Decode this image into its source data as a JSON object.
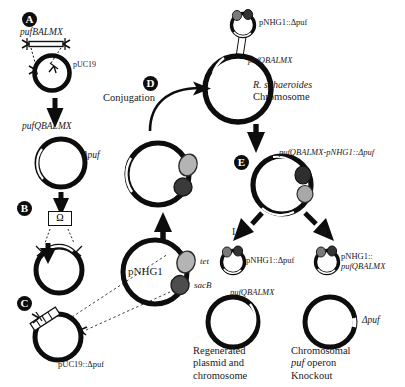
{
  "figure": {
    "width": 405,
    "height": 387,
    "background_color": "#ffffff",
    "ink_color": "#000000",
    "label_color": "#1a1a1a",
    "tet_marker_color": "#b4b4b4",
    "sacb_marker_color": "#4d4d4d",
    "caption_color": "#5d5d5d"
  },
  "steps": [
    {
      "id": "A",
      "letter": "A"
    },
    {
      "id": "B",
      "letter": "B"
    },
    {
      "id": "C",
      "letter": "C"
    },
    {
      "id": "D",
      "letter": "D"
    },
    {
      "id": "E",
      "letter": "E"
    }
  ],
  "branches": [
    {
      "id": "I",
      "label": "I"
    },
    {
      "id": "II",
      "label": "II"
    }
  ],
  "labels": {
    "puf_fragment": "pufBALMX",
    "puc19": "pUC19",
    "puf_qbalmx_plasmid": "pufQBALMX",
    "omega_cassette": "Ω",
    "puc19_delta_puf": "pUC19::Δpuf",
    "delta_puf": "Δpuf",
    "pnhg1": "pNHG1",
    "tet_marker": "tet",
    "sacb_marker": "sacB",
    "conjugation": "Conjugation",
    "pnhg1_delta_puf": "pNHG1::Δpuf",
    "chromosome_puf_operon": "pufQBALMX",
    "host_species": "R. sphaeroides",
    "host_structure": "Chromosome",
    "cointegrate": "pufQBALMX-pNHG1::Δpuf",
    "outcome_i_plasmid": "pNHG1::Δpuf",
    "outcome_i_chromosome": "pufQBALMX",
    "outcome_i_text_line1": "Regenerated",
    "outcome_i_text_line2": "plasmid and",
    "outcome_i_text_line3": "chromosome",
    "outcome_ii_plasmid_line1": "pNHG1::",
    "outcome_ii_plasmid_line2": "pufQBALMX",
    "outcome_ii_chromosome": "Δpuf",
    "outcome_ii_text_line1": "Chromosomal",
    "outcome_ii_text_line2_italic": "puf",
    "outcome_ii_text_line2_rest": " operon",
    "outcome_ii_text_line3": "Knockout"
  },
  "caption": {
    "partial_line_top_left": "chromosome",
    "partial_line_top_right": "Knockout",
    "cut_off_text": ""
  }
}
